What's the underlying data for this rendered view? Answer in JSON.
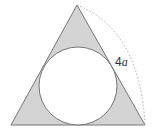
{
  "diagram": {
    "shapes": {
      "triangle": {
        "type": "equilateral-triangle",
        "fill": "#d4d4d4",
        "stroke": "#777777"
      },
      "circle": {
        "type": "inscribed-circle",
        "fill": "#ffffff",
        "stroke": "#777777"
      },
      "arc": {
        "type": "dotted-arc",
        "stroke": "#aaaaaa"
      }
    },
    "labels": {
      "side_num": "4",
      "side_var": "a"
    }
  }
}
